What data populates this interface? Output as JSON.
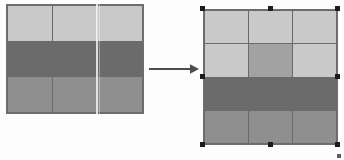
{
  "diagram": {
    "background_color": "#fdfdfd",
    "grid_line_color": "#6a6a6a",
    "border_color": "#6f6f6f"
  },
  "palette": {
    "light_gray": "#c9c9c9",
    "medium_gray": "#8f8f8f",
    "dark_gray": "#6b6b6b",
    "handle_color": "#1c1c1c",
    "arrow_color": "#4d4d4d",
    "checker_overlay": "rgba(0,0,0,.26)"
  },
  "source_grid": {
    "label": "source-grid",
    "columns": 3,
    "rows": 3,
    "cells": [
      {
        "id": "r1c1",
        "row": 1,
        "col": 1,
        "fill": "#c9c9c9",
        "tone": "light",
        "pattern": "solid"
      },
      {
        "id": "r1c2",
        "row": 1,
        "col": 2,
        "fill": "#c9c9c9",
        "tone": "light",
        "pattern": "solid"
      },
      {
        "id": "r1c3",
        "row": 1,
        "col": 3,
        "fill": "#c9c9c9",
        "tone": "light",
        "pattern": "solid"
      },
      {
        "id": "r2c1",
        "row": 2,
        "col": 1,
        "fill": "#6b6b6b",
        "tone": "dark",
        "pattern": "solid"
      },
      {
        "id": "r2c2",
        "row": 2,
        "col": 2,
        "fill": "#6b6b6b",
        "tone": "dark",
        "pattern": "solid"
      },
      {
        "id": "r2c3",
        "row": 2,
        "col": 3,
        "fill": "#6b6b6b",
        "tone": "dark",
        "pattern": "solid"
      },
      {
        "id": "r3c1",
        "row": 3,
        "col": 1,
        "fill": "#8f8f8f",
        "tone": "medium",
        "pattern": "solid"
      },
      {
        "id": "r3c2",
        "row": 3,
        "col": 2,
        "fill": "#8f8f8f",
        "tone": "medium",
        "pattern": "solid"
      },
      {
        "id": "r3c3",
        "row": 3,
        "col": 3,
        "fill": "#8f8f8f",
        "tone": "medium",
        "pattern": "solid"
      }
    ]
  },
  "result_grid": {
    "label": "result-grid",
    "columns": 3,
    "rows": 4,
    "selected": true,
    "cells": [
      {
        "id": "r1c1",
        "row": 1,
        "col": 1,
        "fill": "#c9c9c9",
        "tone": "light",
        "pattern": "solid"
      },
      {
        "id": "r1c2",
        "row": 1,
        "col": 2,
        "fill": "#c9c9c9",
        "tone": "light",
        "pattern": "solid"
      },
      {
        "id": "r1c3",
        "row": 1,
        "col": 3,
        "fill": "#c9c9c9",
        "tone": "light",
        "pattern": "solid"
      },
      {
        "id": "r2c1",
        "row": 2,
        "col": 1,
        "fill": "#c9c9c9",
        "tone": "light",
        "pattern": "solid"
      },
      {
        "id": "r2c2",
        "row": 2,
        "col": 2,
        "fill": "#a2a2a2",
        "tone": "medium",
        "pattern": "checkered"
      },
      {
        "id": "r2c3",
        "row": 2,
        "col": 3,
        "fill": "#c9c9c9",
        "tone": "light",
        "pattern": "solid"
      },
      {
        "id": "r3c1",
        "row": 3,
        "col": 1,
        "fill": "#6b6b6b",
        "tone": "dark",
        "pattern": "solid"
      },
      {
        "id": "r3c2",
        "row": 3,
        "col": 2,
        "fill": "#6b6b6b",
        "tone": "dark",
        "pattern": "solid"
      },
      {
        "id": "r3c3",
        "row": 3,
        "col": 3,
        "fill": "#6b6b6b",
        "tone": "dark",
        "pattern": "solid"
      },
      {
        "id": "r4c1",
        "row": 4,
        "col": 1,
        "fill": "#8f8f8f",
        "tone": "medium",
        "pattern": "solid"
      },
      {
        "id": "r4c2",
        "row": 4,
        "col": 2,
        "fill": "#8f8f8f",
        "tone": "medium",
        "pattern": "solid"
      },
      {
        "id": "r4c3",
        "row": 4,
        "col": 3,
        "fill": "#8f8f8f",
        "tone": "medium",
        "pattern": "solid"
      }
    ],
    "handles": [
      {
        "id": "nw",
        "position": "top-left",
        "x": 0,
        "y": 0
      },
      {
        "id": "n",
        "position": "top-center",
        "x": 50,
        "y": 0
      },
      {
        "id": "ne",
        "position": "top-right",
        "x": 100,
        "y": 0
      },
      {
        "id": "w",
        "position": "middle-left",
        "x": 0,
        "y": 50
      },
      {
        "id": "e",
        "position": "middle-right",
        "x": 100,
        "y": 50
      },
      {
        "id": "sw",
        "position": "bottom-left",
        "x": 0,
        "y": 100
      },
      {
        "id": "s",
        "position": "bottom-center",
        "x": 50,
        "y": 100
      },
      {
        "id": "se",
        "position": "bottom-right",
        "x": 100,
        "y": 100
      }
    ]
  },
  "arrow": {
    "label": "transform-arrow",
    "direction": "right",
    "color": "#4d4d4d"
  },
  "artifacts": {
    "scanline_note": "vertical light scan-line over the source grid",
    "speck_note": "small dark speck at lower-right of the page"
  }
}
